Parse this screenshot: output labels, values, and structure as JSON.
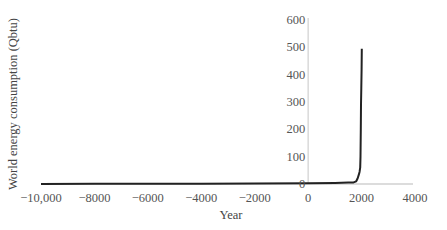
{
  "chart_data": {
    "type": "line",
    "title": "",
    "xlabel": "Year",
    "ylabel": "World energy consumption (Qbtu)",
    "xlim": [
      -10000,
      4000
    ],
    "ylim": [
      0,
      600
    ],
    "x_ticks": [
      -10000,
      -8000,
      -6000,
      -4000,
      -2000,
      0,
      2000,
      4000
    ],
    "x_tick_labels": [
      "−10,000",
      "−8000",
      "−6000",
      "−4000",
      "−2000",
      "0",
      "2000",
      "4000"
    ],
    "y_ticks": [
      0,
      100,
      200,
      300,
      400,
      500,
      600
    ],
    "y_tick_labels": [
      "0",
      "100",
      "200",
      "300",
      "400",
      "500",
      "600"
    ],
    "grid": false,
    "legend": null,
    "series": [
      {
        "name": "World energy consumption",
        "color": "#222222",
        "x": [
          -10000,
          -8000,
          -6000,
          -4000,
          -2000,
          0,
          1000,
          1500,
          1700,
          1800,
          1850,
          1900,
          1925,
          1950,
          1960,
          1970,
          1980,
          1990,
          2000,
          2010
        ],
        "y": [
          0.5,
          0.6,
          0.8,
          1,
          2,
          3,
          4,
          5,
          6,
          10,
          20,
          35,
          45,
          60,
          100,
          200,
          290,
          350,
          420,
          495
        ]
      }
    ],
    "axis_color": "#d0d0d0"
  }
}
